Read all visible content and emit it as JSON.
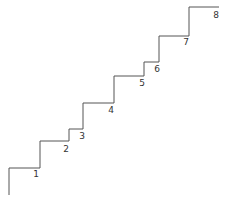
{
  "diagram": {
    "type": "staircase",
    "line_color": "#555555",
    "steps": [
      {
        "label": "1",
        "lx": 36,
        "ly": 177
      },
      {
        "label": "2",
        "lx": 66,
        "ly": 152
      },
      {
        "label": "3",
        "lx": 82,
        "ly": 139
      },
      {
        "label": "4",
        "lx": 111,
        "ly": 113
      },
      {
        "label": "5",
        "lx": 142,
        "ly": 86
      },
      {
        "label": "6",
        "lx": 157,
        "ly": 72
      },
      {
        "label": "7",
        "lx": 186,
        "ly": 45
      },
      {
        "label": "8",
        "lx": 216,
        "ly": 18
      }
    ]
  }
}
